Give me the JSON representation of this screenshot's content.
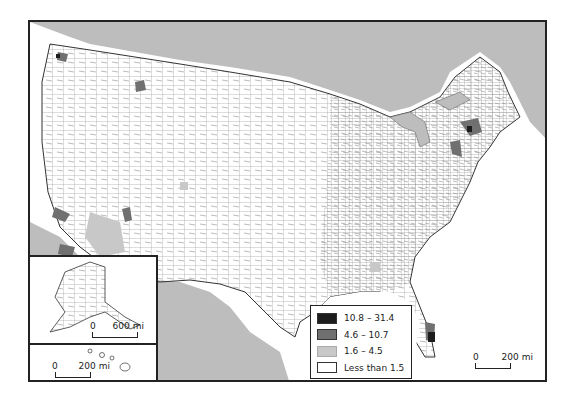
{
  "map": {
    "type": "choropleth",
    "subject": "United States counties",
    "colors": {
      "ocean": "#bdbdbd",
      "land": "#ffffff",
      "border": "#555555",
      "frame": "#222222"
    }
  },
  "legend": {
    "items": [
      {
        "label": "10.8 – 31.4",
        "color": "#1c1c1c"
      },
      {
        "label": "4.6 – 10.7",
        "color": "#707070"
      },
      {
        "label": "1.6 – 4.5",
        "color": "#c8c8c8"
      },
      {
        "label": "Less than 1.5",
        "color": "#ffffff"
      }
    ]
  },
  "scales": {
    "main": {
      "zero": "0",
      "distance": "200 mi"
    },
    "alaska": {
      "zero": "0",
      "distance": "600 mi"
    },
    "hawaii": {
      "zero": "0",
      "distance": "200 mi"
    }
  },
  "insets": [
    "Alaska",
    "Hawaii"
  ]
}
